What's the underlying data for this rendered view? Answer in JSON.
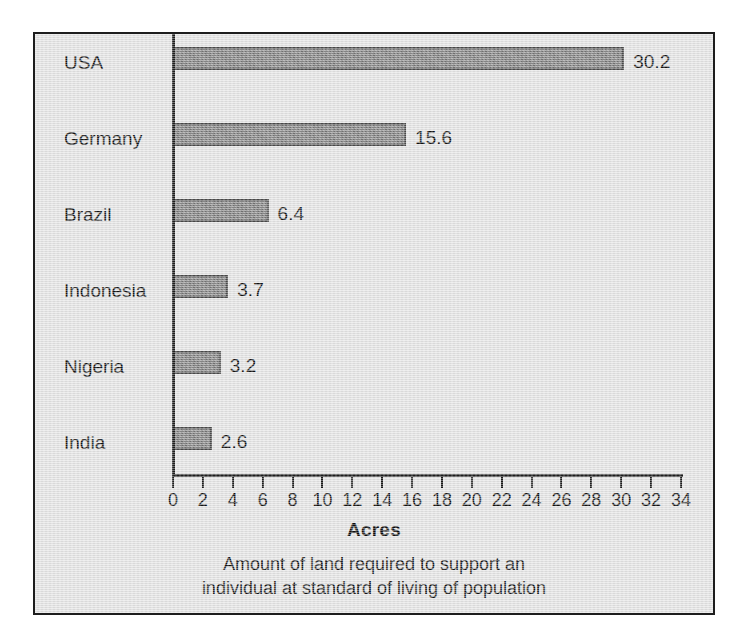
{
  "chart_data": {
    "type": "bar",
    "orientation": "horizontal",
    "title": "",
    "xlabel": "Acres",
    "ylabel": "",
    "caption_line1": "Amount of land required to support an",
    "caption_line2": "individual at standard of living of population",
    "categories": [
      "USA",
      "Germany",
      "Brazil",
      "Indonesia",
      "Nigeria",
      "India"
    ],
    "values": [
      30.2,
      15.6,
      6.4,
      3.7,
      3.2,
      2.6
    ],
    "value_labels": [
      "30.2",
      "15.6",
      "6.4",
      "3.7",
      "3.2",
      "2.6"
    ],
    "xlim": [
      0,
      34
    ],
    "xtick_step": 2,
    "xticks": [
      0,
      2,
      4,
      6,
      8,
      10,
      12,
      14,
      16,
      18,
      20,
      22,
      24,
      26,
      28,
      30,
      32,
      34
    ],
    "xtick_labels": [
      "0",
      "2",
      "4",
      "6",
      "8",
      "10",
      "12",
      "14",
      "16",
      "18",
      "20",
      "22",
      "24",
      "26",
      "28",
      "30",
      "32",
      "34"
    ],
    "grid": false,
    "legend": false,
    "colors": {
      "bar_fill": "#7e7e7e",
      "bar_edge": "#4a4a4a",
      "panel_background": "#e4e4e4",
      "panel_border": "#1d1d1d",
      "axis": "#1d1d1d",
      "text": "#111111",
      "page_background": "#ffffff"
    }
  }
}
